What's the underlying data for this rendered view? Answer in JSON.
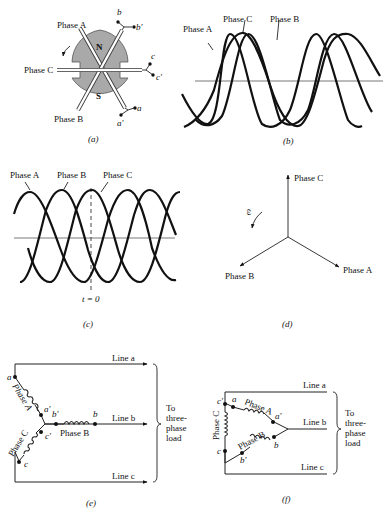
{
  "figure_a": {
    "caption": "(a)",
    "rotor_labels": {
      "north": "N",
      "south": "S"
    },
    "phase_labels": [
      "Phase A",
      "Phase B",
      "Phase C"
    ],
    "terminals": [
      "a",
      "a'",
      "b",
      "b'",
      "c",
      "c'"
    ]
  },
  "figure_b": {
    "caption": "(b)",
    "labels": [
      "Phase A",
      "Phase C",
      "Phase B"
    ]
  },
  "figure_c": {
    "caption": "(c)",
    "labels": [
      "Phase A",
      "Phase B",
      "Phase C"
    ],
    "marker": "t = 0"
  },
  "figure_d": {
    "caption": "(d)",
    "phasors": [
      {
        "label": "Phase C",
        "angle_deg": 90
      },
      {
        "label": "Phase A",
        "angle_deg": -30
      },
      {
        "label": "Phase B",
        "angle_deg": 210
      }
    ],
    "rotation_symbol": "ω"
  },
  "figure_e": {
    "caption": "(e)",
    "connection": "wye",
    "lines": [
      "Line a",
      "Line b",
      "Line c"
    ],
    "phases": [
      "Phase A",
      "Phase B",
      "Phase C"
    ],
    "terminals": [
      "a",
      "a'",
      "b",
      "b'",
      "c",
      "c'"
    ],
    "load_label": [
      "To",
      "three-",
      "phase",
      "load"
    ]
  },
  "figure_f": {
    "caption": "(f)",
    "connection": "delta",
    "lines": [
      "Line a",
      "Line b",
      "Line c"
    ],
    "phases": [
      "Phase A",
      "Phase B",
      "Phase C"
    ],
    "terminals": [
      "a",
      "a'",
      "b",
      "b'",
      "c",
      "c'"
    ],
    "load_label": [
      "To",
      "three-",
      "phase",
      "load"
    ]
  }
}
